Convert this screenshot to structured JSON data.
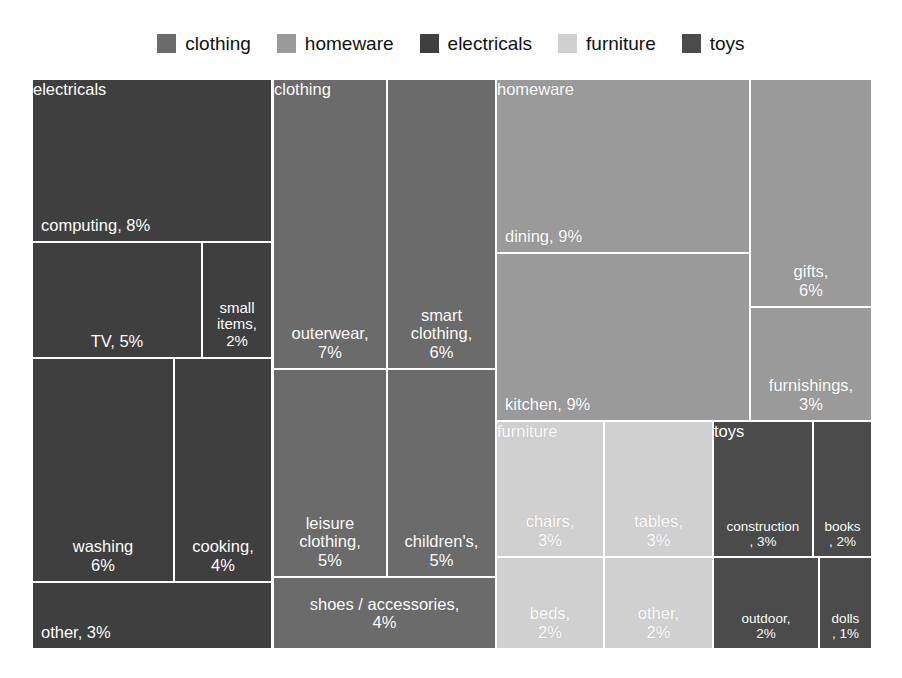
{
  "legend": {
    "items": [
      {
        "label": "clothing",
        "color": "#6b6b6b"
      },
      {
        "label": "homeware",
        "color": "#9a9a9a"
      },
      {
        "label": "electricals",
        "color": "#3f3f3f"
      },
      {
        "label": "furniture",
        "color": "#d0d0d0"
      },
      {
        "label": "toys",
        "color": "#4b4b4b"
      }
    ]
  },
  "chart_data": {
    "type": "treemap",
    "title": "",
    "value_unit": "%",
    "grid": false,
    "legend_position": "top",
    "gap_color": "#ffffff",
    "label_color": "#ffffff",
    "groups": [
      {
        "name": "electricals",
        "color": "#3f3f3f",
        "total": 28,
        "children": [
          {
            "label": "computing, 8%",
            "name": "computing",
            "value": 8
          },
          {
            "label": "TV, 5%",
            "name": "TV",
            "value": 5
          },
          {
            "label": "small items,\n2%",
            "name": "small items",
            "value": 2
          },
          {
            "label": "washing\n6%",
            "name": "washing",
            "value": 6
          },
          {
            "label": "cooking,\n4%",
            "name": "cooking",
            "value": 4
          },
          {
            "label": "other, 3%",
            "name": "other",
            "value": 3
          }
        ]
      },
      {
        "name": "clothing",
        "color": "#6b6b6b",
        "total": 27,
        "children": [
          {
            "label": "outerwear,\n7%",
            "name": "outerwear",
            "value": 7
          },
          {
            "label": "smart\nclothing,\n6%",
            "name": "smart clothing",
            "value": 6
          },
          {
            "label": "leisure\nclothing,\n5%",
            "name": "leisure clothing",
            "value": 5
          },
          {
            "label": "children's,\n5%",
            "name": "children's",
            "value": 5
          },
          {
            "label": "shoes / accessories,\n4%",
            "name": "shoes / accessories",
            "value": 4
          }
        ]
      },
      {
        "name": "homeware",
        "color": "#9a9a9a",
        "total": 27,
        "children": [
          {
            "label": "dining, 9%",
            "name": "dining",
            "value": 9
          },
          {
            "label": "kitchen, 9%",
            "name": "kitchen",
            "value": 9
          },
          {
            "label": "gifts,\n6%",
            "name": "gifts",
            "value": 6
          },
          {
            "label": "furnishings,\n3%",
            "name": "furnishings",
            "value": 3
          }
        ]
      },
      {
        "name": "furniture",
        "color": "#d0d0d0",
        "total": 10,
        "children": [
          {
            "label": "chairs,\n3%",
            "name": "chairs",
            "value": 3
          },
          {
            "label": "tables,\n3%",
            "name": "tables",
            "value": 3
          },
          {
            "label": "beds,\n2%",
            "name": "beds",
            "value": 2
          },
          {
            "label": "other,\n2%",
            "name": "other",
            "value": 2
          }
        ]
      },
      {
        "name": "toys",
        "color": "#4b4b4b",
        "total": 8,
        "children": [
          {
            "label": "construction\n, 3%",
            "name": "construction",
            "value": 3
          },
          {
            "label": "books\n, 2%",
            "name": "books",
            "value": 2
          },
          {
            "label": "outdoor,\n2%",
            "name": "outdoor",
            "value": 2
          },
          {
            "label": "dolls\n, 1%",
            "name": "dolls",
            "value": 1
          }
        ]
      }
    ]
  }
}
